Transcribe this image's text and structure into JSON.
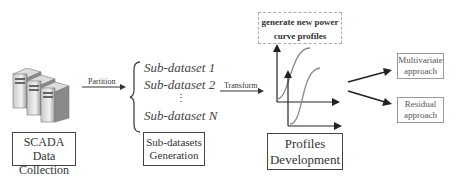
{
  "diagram": {
    "stage1": {
      "label_line1": "SCADA Data",
      "label_line2": "Collection"
    },
    "edge1": {
      "label": "Partition"
    },
    "stage2": {
      "items": [
        "Sub-dataset 1",
        "Sub-dataset 2",
        "⋮",
        "Sub-dataset N"
      ],
      "label_line1": "Sub-datasets",
      "label_line2": "Generation"
    },
    "edge2": {
      "label": "Transform"
    },
    "stage3": {
      "note_line1": "generate new power",
      "note_line2": "curve profiles",
      "label_line1": "Profiles",
      "label_line2": "Development"
    },
    "outputs": [
      {
        "label_line1": "Multivariate",
        "label_line2": "approach"
      },
      {
        "label_line1": "Residual",
        "label_line2": "approach"
      }
    ]
  }
}
